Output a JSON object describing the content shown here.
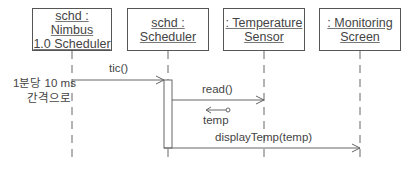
{
  "diagram": {
    "type": "UML sequence diagram",
    "objects": [
      {
        "id": "nimbus",
        "label": "schd : Nimbus\n1.0 Scheduler"
      },
      {
        "id": "scheduler",
        "label": "schd : Scheduler"
      },
      {
        "id": "sensor",
        "label": ": Temperature\nSensor"
      },
      {
        "id": "screen",
        "label": ": Monitoring\nScreen"
      }
    ],
    "messages": [
      {
        "from": "nimbus",
        "to": "scheduler",
        "label": "tic()"
      },
      {
        "from": "scheduler",
        "to": "sensor",
        "label": "read()"
      },
      {
        "from": "sensor",
        "to": "scheduler",
        "label": "temp",
        "kind": "return-data"
      },
      {
        "from": "scheduler",
        "to": "screen",
        "label": "displayTemp(temp)"
      }
    ],
    "note": {
      "line1": "1분당 10 ms",
      "line2": "간격으로"
    },
    "colors": {
      "line": "#555555",
      "text": "#444444"
    }
  }
}
